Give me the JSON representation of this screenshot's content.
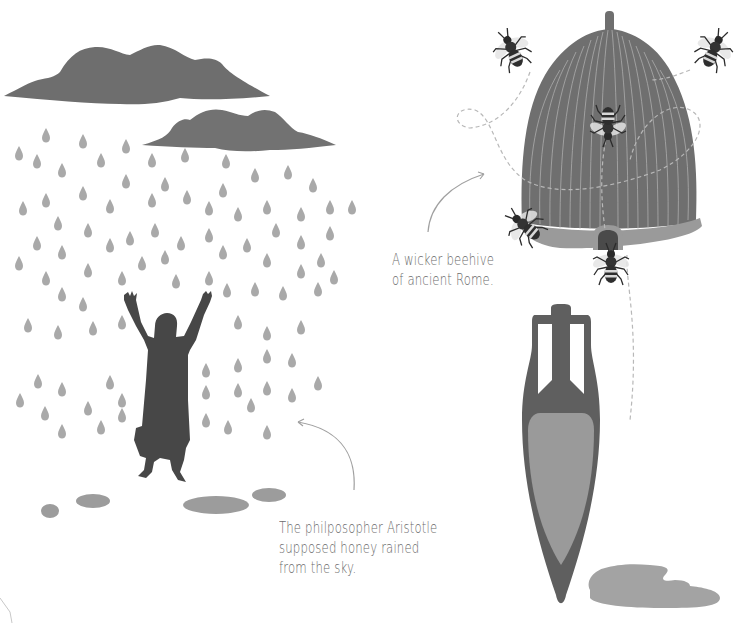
{
  "captions": {
    "aristotle": {
      "lines": [
        "The philposopher Aristotle",
        "supposed honey rained",
        "from the sky."
      ]
    },
    "beehive": {
      "lines": [
        "A wicker beehive",
        "of ancient Rome."
      ]
    }
  },
  "illustrations": {
    "clouds": [
      "large-cloud",
      "small-cloud"
    ],
    "figure": "aristotle-silhouette-arms-raised",
    "drops": "honey-raindrops",
    "puddles": 4,
    "beehive": "wicker-skep-beehive",
    "bees": 5,
    "amphora": "honey-amphora",
    "spill": "honey-puddle"
  },
  "colors": {
    "background": "#ffffff",
    "cloud": "#6e6e6e",
    "drop": "#a9a9a9",
    "figure": "#474747",
    "puddle": "#9c9c9c",
    "hive": "#6f6f6f",
    "hive_lines": "#bdbdbd",
    "hive_rim": "#9a9a9a",
    "amphora": "#5f5f5f",
    "amphora_fill": "#9a9a9a",
    "caption_text": "#6b6b6b",
    "arrow": "#a0a0a0"
  }
}
